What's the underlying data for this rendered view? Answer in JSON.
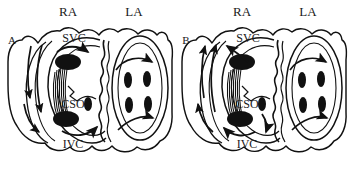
{
  "figure": {
    "type": "anatomical-diagram",
    "background_color": "#ffffff",
    "ink_color": "#111111",
    "panel_count": 2
  },
  "panels": [
    {
      "id": "A",
      "label": "A",
      "label_x": 12,
      "label_y": 44,
      "offset_x": 0,
      "ra_flow": "clockwise",
      "la_flow": "clockwise",
      "chambers": [
        {
          "name": "right-atrium",
          "abbr": "RA",
          "label": "RA",
          "label_x": 68,
          "label_y": 16,
          "structures": [
            {
              "name": "superior-vena-cava",
              "abbr": "SVC",
              "label": "SVC",
              "label_x": 74,
              "label_y": 42
            },
            {
              "name": "inferior-vena-cava",
              "abbr": "IVC",
              "label": "IVC",
              "label_x": 73,
              "label_y": 148
            },
            {
              "name": "coronary-sinus-ostium",
              "abbr": "CSO",
              "label": "CSO",
              "label_x": 73,
              "label_y": 108
            },
            {
              "name": "crista-terminalis",
              "abbr": "CT",
              "label": ""
            }
          ],
          "ostia": [
            {
              "name": "svc-ostium",
              "cx": 68,
              "cy": 62,
              "rx": 13,
              "ry": 8
            },
            {
              "name": "ivc-ostium",
              "cx": 66,
              "cy": 119,
              "rx": 13,
              "ry": 8
            },
            {
              "name": "coronary-sinus-ostium",
              "cx": 88,
              "cy": 104,
              "rx": 4,
              "ry": 7
            }
          ]
        },
        {
          "name": "left-atrium",
          "abbr": "LA",
          "label": "LA",
          "label_x": 134,
          "label_y": 16,
          "structures": [
            {
              "name": "interatrial-septum",
              "abbr": "IAS",
              "label": ""
            }
          ],
          "ostia": [
            {
              "name": "pulmonary-vein-ostium-upper-left",
              "cx": 128,
              "cy": 80,
              "rx": 4,
              "ry": 8
            },
            {
              "name": "pulmonary-vein-ostium-upper-right",
              "cx": 147,
              "cy": 79,
              "rx": 4,
              "ry": 8
            },
            {
              "name": "pulmonary-vein-ostium-lower-left",
              "cx": 129,
              "cy": 105,
              "rx": 4,
              "ry": 8
            },
            {
              "name": "pulmonary-vein-ostium-lower-right",
              "cx": 148,
              "cy": 104,
              "rx": 4,
              "ry": 8
            }
          ]
        }
      ]
    },
    {
      "id": "B",
      "label": "B",
      "label_x": 186,
      "label_y": 44,
      "offset_x": 174,
      "ra_flow": "counterclockwise",
      "la_flow": "clockwise",
      "chambers": [
        {
          "name": "right-atrium",
          "abbr": "RA",
          "label": "RA",
          "label_x": 242,
          "label_y": 16,
          "structures": [
            {
              "name": "superior-vena-cava",
              "abbr": "SVC",
              "label": "SVC",
              "label_x": 248,
              "label_y": 42
            },
            {
              "name": "inferior-vena-cava",
              "abbr": "IVC",
              "label": "IVC",
              "label_x": 247,
              "label_y": 148
            },
            {
              "name": "coronary-sinus-ostium",
              "abbr": "CSO",
              "label": "CSO",
              "label_x": 247,
              "label_y": 108
            },
            {
              "name": "crista-terminalis",
              "abbr": "CT",
              "label": ""
            }
          ],
          "ostia": [
            {
              "name": "svc-ostium",
              "cx": 242,
              "cy": 62,
              "rx": 13,
              "ry": 8
            },
            {
              "name": "ivc-ostium",
              "cx": 240,
              "cy": 119,
              "rx": 13,
              "ry": 8
            },
            {
              "name": "coronary-sinus-ostium",
              "cx": 262,
              "cy": 104,
              "rx": 4,
              "ry": 7
            }
          ]
        },
        {
          "name": "left-atrium",
          "abbr": "LA",
          "label": "LA",
          "label_x": 308,
          "label_y": 16,
          "structures": [
            {
              "name": "interatrial-septum",
              "abbr": "IAS",
              "label": ""
            }
          ],
          "ostia": [
            {
              "name": "pulmonary-vein-ostium-upper-left",
              "cx": 302,
              "cy": 80,
              "rx": 4,
              "ry": 8
            },
            {
              "name": "pulmonary-vein-ostium-upper-right",
              "cx": 321,
              "cy": 79,
              "rx": 4,
              "ry": 8
            },
            {
              "name": "pulmonary-vein-ostium-lower-left",
              "cx": 303,
              "cy": 105,
              "rx": 4,
              "ry": 8
            },
            {
              "name": "pulmonary-vein-ostium-lower-right",
              "cx": 322,
              "cy": 104,
              "rx": 4,
              "ry": 8
            }
          ]
        }
      ]
    }
  ],
  "legend": {
    "abbreviations": [
      {
        "abbr": "RA",
        "meaning": "right atrium"
      },
      {
        "abbr": "LA",
        "meaning": "left atrium"
      },
      {
        "abbr": "SVC",
        "meaning": "superior vena cava"
      },
      {
        "abbr": "IVC",
        "meaning": "inferior vena cava"
      },
      {
        "abbr": "CSO",
        "meaning": "coronary sinus ostium"
      }
    ]
  }
}
